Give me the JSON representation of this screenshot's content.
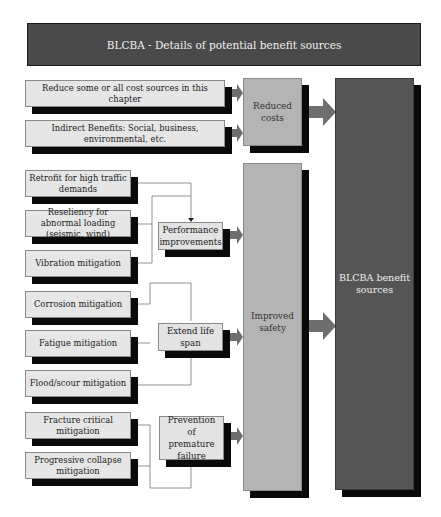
{
  "title": "BLCBA - Details of potential benefit sources",
  "sources": [
    {
      "id": "reduce-cost-sources",
      "label": "Reduce some or all cost sources in this chapter"
    },
    {
      "id": "indirect-benefits",
      "label": "Indirect Benefits: Social, business, environmental, etc."
    },
    {
      "id": "retrofit",
      "label": "Retrofit for high traffic demands"
    },
    {
      "id": "resiliency",
      "label": "Reseliency for abnormal loading (seismic, wind)"
    },
    {
      "id": "vibration",
      "label": "Vibration mitigation"
    },
    {
      "id": "corrosion",
      "label": "Corrosion mitigation"
    },
    {
      "id": "fatigue",
      "label": "Fatigue mitigation"
    },
    {
      "id": "flood-scour",
      "label": "Flood/scour mitigation"
    },
    {
      "id": "fracture-critical",
      "label": "Fracture critical mitigation"
    },
    {
      "id": "progressive-collapse",
      "label": "Progressive collapse mitigation"
    }
  ],
  "intermediate": [
    {
      "id": "performance",
      "label": "Performance improvements"
    },
    {
      "id": "extend-life",
      "label": "Extend life span"
    },
    {
      "id": "prevention",
      "label": "Prevention of premature failure"
    }
  ],
  "categories": [
    {
      "id": "reduced-costs",
      "label": "Reduced costs"
    },
    {
      "id": "improved-safety",
      "label": "Improved safety"
    }
  ],
  "final": {
    "label": "BLCBA benefit sources"
  },
  "colors": {
    "title_bg": "#4a4a4a",
    "source_bg": "#e6e6e6",
    "category_bg": "#b4b4b4",
    "final_bg": "#555555",
    "arrow": "#6e6e6e",
    "shadow": "#0a0a0a"
  }
}
